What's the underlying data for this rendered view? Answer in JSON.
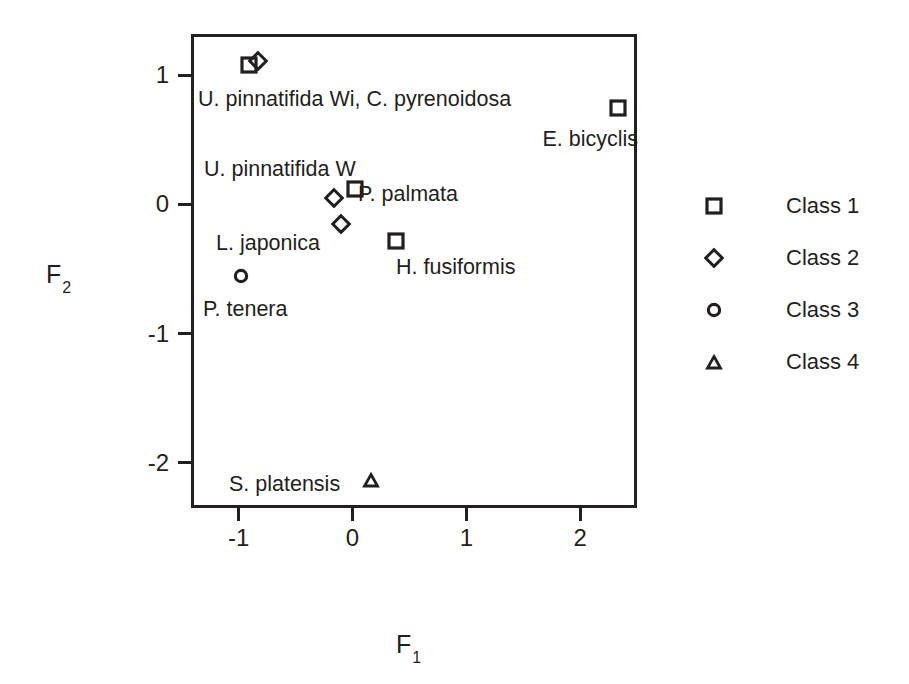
{
  "chart_data": {
    "type": "scatter",
    "title": "",
    "xlabel": "F1",
    "ylabel": "F2",
    "xlabel_base": "F",
    "xlabel_sub": "1",
    "ylabel_base": "F",
    "ylabel_sub": "2",
    "xlim": [
      -1.42,
      2.5
    ],
    "ylim": [
      -2.35,
      1.32
    ],
    "xticks": [
      -1,
      0,
      1,
      2
    ],
    "xticklabels": [
      "-1",
      "0",
      "1",
      "2"
    ],
    "yticks": [
      1,
      0,
      -1,
      -2
    ],
    "yticklabels": [
      "1",
      "0",
      "-1",
      "-2"
    ],
    "grid": false,
    "legend_position": "right",
    "marker_color": "#231f20",
    "points": [
      {
        "label": "U. pinnatifida Wi",
        "class": "Class 1",
        "marker": "square",
        "x": -0.91,
        "y": 1.08
      },
      {
        "label": "C. pyrenoidosa",
        "class": "Class 2",
        "marker": "diamond",
        "x": -0.83,
        "y": 1.11
      },
      {
        "label": "E. bicyclis",
        "class": "Class 1",
        "marker": "square",
        "x": 2.33,
        "y": 0.75
      },
      {
        "label": "U. pinnatifida W",
        "class": "Class 2",
        "marker": "diamond",
        "x": -0.16,
        "y": 0.05
      },
      {
        "label": "P. palmata",
        "class": "Class 1",
        "marker": "square",
        "x": 0.02,
        "y": 0.12
      },
      {
        "label": "L. japonica",
        "class": "Class 2",
        "marker": "diamond",
        "x": -0.1,
        "y": -0.15
      },
      {
        "label": "P. tenera",
        "class": "Class 3",
        "marker": "circle",
        "x": -0.98,
        "y": -0.55
      },
      {
        "label": "H. fusiformis",
        "class": "Class 1",
        "marker": "square",
        "x": 0.38,
        "y": -0.28
      },
      {
        "label": "S. platensis",
        "class": "Class 4",
        "marker": "triangle",
        "x": 0.16,
        "y": -2.13
      }
    ],
    "annotations": [
      {
        "text": "U. pinnatifida Wi, C. pyrenoidosa",
        "x": 198,
        "y": 100,
        "align": "left"
      },
      {
        "text": "E. bicyclis",
        "x": 638,
        "y": 140,
        "align": "right"
      },
      {
        "text": "U. pinnatifida W",
        "x": 204,
        "y": 170,
        "align": "left"
      },
      {
        "text": "P. palmata",
        "x": 358,
        "y": 195,
        "align": "left"
      },
      {
        "text": "L. japonica",
        "x": 216,
        "y": 244,
        "align": "left"
      },
      {
        "text": "P. tenera",
        "x": 203,
        "y": 310,
        "align": "left"
      },
      {
        "text": "H. fusiformis",
        "x": 396,
        "y": 268,
        "align": "left"
      },
      {
        "text": "S. platensis",
        "x": 229,
        "y": 485,
        "align": "left"
      }
    ],
    "legend": [
      {
        "label": "Class 1",
        "marker": "square"
      },
      {
        "label": "Class 2",
        "marker": "diamond"
      },
      {
        "label": "Class 3",
        "marker": "circle"
      },
      {
        "label": "Class 4",
        "marker": "triangle"
      }
    ]
  }
}
